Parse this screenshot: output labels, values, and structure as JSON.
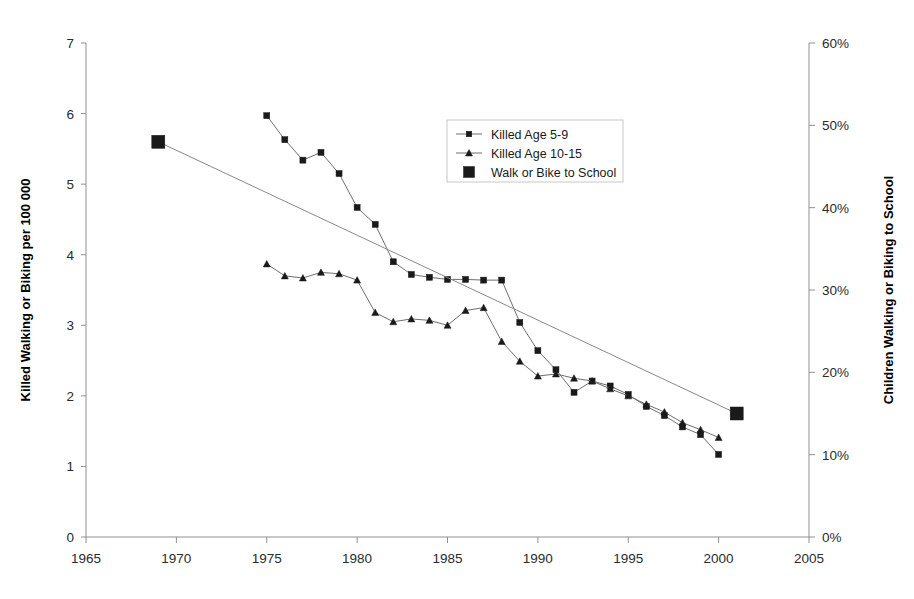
{
  "chart_data": {
    "type": "line",
    "title": "",
    "xlabel": "",
    "ylabel": "Killed Walking or Biking per 100 000",
    "y2label": "Children Walking or Biking to School",
    "xlim": [
      1965,
      2005
    ],
    "ylim": [
      0,
      7
    ],
    "y2lim": [
      0,
      60
    ],
    "grid": false,
    "legend_position": "upper-right",
    "xticks": [
      "1965",
      "1970",
      "1975",
      "1980",
      "1985",
      "1990",
      "1995",
      "2000",
      "2005"
    ],
    "xtick_values": [
      1965,
      1970,
      1975,
      1980,
      1985,
      1990,
      1995,
      2000,
      2005
    ],
    "yticks": [
      "0",
      "1",
      "2",
      "3",
      "4",
      "5",
      "6",
      "7"
    ],
    "ytick_values": [
      0,
      1,
      2,
      3,
      4,
      5,
      6,
      7
    ],
    "y2ticks": [
      "0%",
      "10%",
      "20%",
      "30%",
      "40%",
      "50%",
      "60%"
    ],
    "y2tick_values": [
      0,
      10,
      20,
      30,
      40,
      50,
      60
    ],
    "series": [
      {
        "name": "Killed Age 5-9",
        "marker": "square",
        "axis": "left",
        "x": [
          1975,
          1976,
          1977,
          1978,
          1979,
          1980,
          1981,
          1982,
          1983,
          1984,
          1985,
          1986,
          1987,
          1988,
          1989,
          1990,
          1991,
          1992,
          1993,
          1994,
          1995,
          1996,
          1997,
          1998,
          1999,
          2000
        ],
        "values": [
          5.97,
          5.63,
          5.34,
          5.45,
          5.15,
          4.67,
          4.43,
          3.9,
          3.72,
          3.68,
          3.65,
          3.65,
          3.64,
          3.64,
          3.04,
          2.64,
          2.37,
          2.05,
          2.21,
          2.14,
          2.02,
          1.85,
          1.72,
          1.56,
          1.45,
          1.17
        ]
      },
      {
        "name": "Killed Age 10-15",
        "marker": "triangle",
        "axis": "left",
        "x": [
          1975,
          1976,
          1977,
          1978,
          1979,
          1980,
          1981,
          1982,
          1983,
          1984,
          1985,
          1986,
          1987,
          1988,
          1989,
          1990,
          1991,
          1992,
          1993,
          1994,
          1995,
          1996,
          1997,
          1998,
          1999,
          2000
        ],
        "values": [
          3.87,
          3.7,
          3.67,
          3.75,
          3.73,
          3.64,
          3.18,
          3.05,
          3.09,
          3.07,
          3.0,
          3.21,
          3.25,
          2.77,
          2.49,
          2.28,
          2.31,
          2.25,
          2.21,
          2.1,
          2.0,
          1.88,
          1.77,
          1.62,
          1.52,
          1.41
        ]
      },
      {
        "name": "Walk or Bike to School",
        "marker": "big-square",
        "axis": "right",
        "x": [
          1969,
          2001
        ],
        "values": [
          48.0,
          15.0
        ]
      }
    ],
    "legend": [
      {
        "label": "Killed Age 5-9",
        "marker": "square-line"
      },
      {
        "label": "Killed Age 10-15",
        "marker": "triangle-line"
      },
      {
        "label": "Walk or Bike to School",
        "marker": "big-square"
      }
    ],
    "colors": {
      "marker": "#1a1a1a",
      "line": "#6e6e6e",
      "axis": "#909090",
      "text": "#1a1a1a",
      "background": "#ffffff"
    }
  }
}
